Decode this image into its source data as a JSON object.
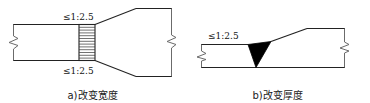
{
  "figure": {
    "ink_color": "#222222",
    "weld_fill_color": "#000000",
    "background_color": "#ffffff"
  },
  "panels": [
    {
      "id": "a",
      "caption": "a)改变宽度",
      "labels": {
        "top_ratio": "≤1:2.5",
        "bottom_ratio": "≤1:2.5"
      },
      "elements": {
        "narrow_plate": "窄板",
        "wide_plate": "宽板",
        "weld_seam": "对接焊缝(剖面线)",
        "break_symbol_left": "断开符号",
        "break_symbol_right": "断开符号",
        "taper_top": "上侧斜向过渡",
        "taper_bottom": "下侧斜向过渡"
      },
      "hatch_line_count": 13
    },
    {
      "id": "b",
      "caption": "b)改变厚度",
      "labels": {
        "top_ratio": "≤1:2.5"
      },
      "elements": {
        "thin_plate": "薄板",
        "thick_plate": "厚板",
        "weld_triangle": "焊缝(填充三角形)",
        "break_symbol_left": "断开符号",
        "break_symbol_right": "断开符号",
        "taper_slope": "斜向过渡面"
      }
    }
  ]
}
